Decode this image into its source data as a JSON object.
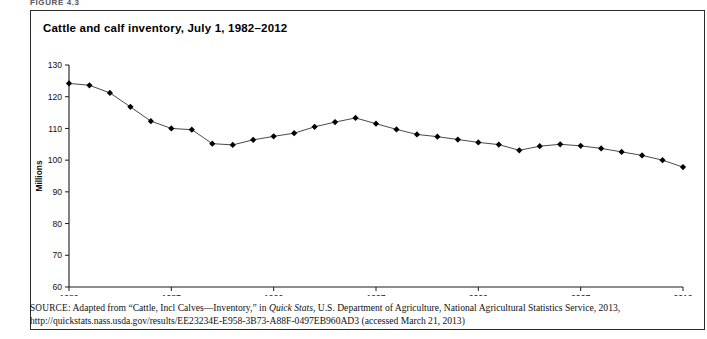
{
  "figure": {
    "label": "FIGURE 4.3",
    "title": "Cattle and calf inventory, July 1, 1982–2012"
  },
  "source": {
    "prefix": "SOURCE",
    "line1_a": "Adapted from “Cattle, Incl Calves—Inventory,” in ",
    "line1_italic": "Quick Stats",
    "line1_b": ", U.S. Department of Agriculture, National Agricultural Statistics Service, 2013,",
    "line2": "http://quickstats.nass.usda.gov/results/EE23234E-E958-3B73-A88F-0497EB960AD3 (accessed March 21, 2013)"
  },
  "colors": {
    "line": "#4a4a4a",
    "marker": "#000000",
    "axis": "#1a1a1a",
    "border": "#2b2b2b",
    "background": "#ffffff"
  },
  "chart_data": {
    "type": "line",
    "title": "Cattle and calf inventory, July 1, 1982–2012",
    "xlabel": "",
    "ylabel": "Millions",
    "xlim": [
      1982,
      2012
    ],
    "ylim": [
      60,
      130
    ],
    "yticks": [
      60,
      70,
      80,
      90,
      100,
      110,
      120,
      130
    ],
    "xticks": [
      1982,
      1987,
      1992,
      1997,
      2002,
      2007,
      2012
    ],
    "grid": false,
    "legend": null,
    "marker": "diamond",
    "x": [
      1982,
      1983,
      1984,
      1985,
      1986,
      1987,
      1988,
      1989,
      1990,
      1991,
      1992,
      1993,
      1994,
      1995,
      1996,
      1997,
      1998,
      1999,
      2000,
      2001,
      2002,
      2003,
      2004,
      2005,
      2006,
      2007,
      2008,
      2009,
      2010,
      2011,
      2012
    ],
    "values": [
      124.2,
      123.6,
      121.2,
      116.8,
      112.3,
      110.0,
      109.6,
      105.2,
      104.8,
      106.4,
      107.5,
      108.5,
      110.5,
      112.0,
      113.3,
      111.5,
      109.7,
      108.1,
      107.4,
      106.5,
      105.6,
      104.9,
      103.1,
      104.4,
      105.0,
      104.5,
      103.7,
      102.6,
      101.5,
      100.0,
      97.8
    ],
    "series": [
      {
        "name": "Cattle and calf inventory (millions)",
        "values": [
          124.2,
          123.6,
          121.2,
          116.8,
          112.3,
          110.0,
          109.6,
          105.2,
          104.8,
          106.4,
          107.5,
          108.5,
          110.5,
          112.0,
          113.3,
          111.5,
          109.7,
          108.1,
          107.4,
          106.5,
          105.6,
          104.9,
          103.1,
          104.4,
          105.0,
          104.5,
          103.7,
          102.6,
          101.5,
          100.0,
          97.8
        ]
      }
    ]
  }
}
